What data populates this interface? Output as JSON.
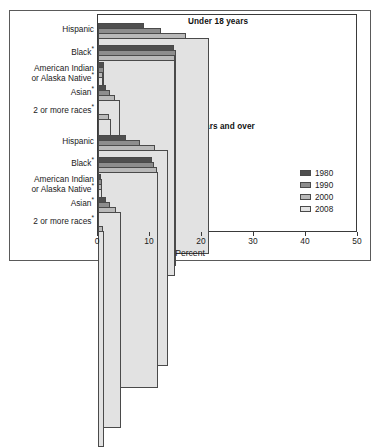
{
  "chart_data": {
    "type": "bar",
    "orientation": "horizontal",
    "title": "",
    "xlabel": "Percent",
    "ylabel": "",
    "xlim": [
      0,
      50
    ],
    "xticks": [
      0,
      10,
      20,
      30,
      40,
      50
    ],
    "grid": false,
    "legend_position": "right-middle",
    "series_names": [
      "1980",
      "1990",
      "2000",
      "2008"
    ],
    "series_colors": [
      "#4f4f4f",
      "#8d8d8d",
      "#b9b9b9",
      "#e2e2e2"
    ],
    "panels": [
      {
        "title": "Under 18 years",
        "categories": [
          "Hispanic",
          "Black*",
          "American Indian or Alaska Native*",
          "Asian*",
          "2 or more races*"
        ],
        "series": [
          {
            "name": "1980",
            "values": [
              8.8,
              14.6,
              1.1,
              1.5,
              null
            ]
          },
          {
            "name": "1990",
            "values": [
              12.1,
              15.0,
              1.2,
              2.3,
              null
            ]
          },
          {
            "name": "2000",
            "values": [
              17.0,
              14.9,
              1.0,
              3.3,
              2.2
            ]
          },
          {
            "name": "2008",
            "values": [
              21.3,
              14.8,
              1.0,
              4.2,
              2.5
            ]
          }
        ]
      },
      {
        "title": "18 years and over",
        "categories": [
          "Hispanic",
          "Black*",
          "American Indian or Alaska Native*",
          "Asian*",
          "2 or more races*"
        ],
        "series": [
          {
            "name": "1980",
            "values": [
              5.4,
              10.3,
              0.6,
              1.5,
              null
            ]
          },
          {
            "name": "1990",
            "values": [
              8.0,
              10.7,
              0.7,
              2.4,
              null
            ]
          },
          {
            "name": "2000",
            "values": [
              10.9,
              11.3,
              0.8,
              3.5,
              1.0
            ]
          },
          {
            "name": "2008",
            "values": [
              13.5,
              11.6,
              0.8,
              4.4,
              1.1
            ]
          }
        ]
      }
    ]
  },
  "labels": {
    "panel_titles": {
      "under18": "Under 18 years",
      "over18": "18 years and over"
    },
    "categories": {
      "hispanic": "Hispanic",
      "black": "Black",
      "american_indian_line1": "American Indian",
      "american_indian_line2": "or Alaska Native",
      "asian": "Asian",
      "two_or_more": "2 or more races",
      "asterisk": "*"
    },
    "xticks": [
      "0",
      "10",
      "20",
      "30",
      "40",
      "50"
    ],
    "xlabel": "Percent",
    "legend": [
      "1980",
      "1990",
      "2000",
      "2008"
    ]
  }
}
